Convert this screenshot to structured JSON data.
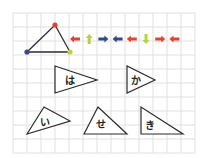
{
  "grid": {
    "x": 13,
    "y": 13,
    "cols": 13,
    "rows": 10,
    "cell": 14,
    "line_color": "#d9d9d9"
  },
  "reference_triangle": {
    "vertices": [
      {
        "name": "blue-vertex",
        "x": 27,
        "y": 52,
        "color": "#3b4a8a"
      },
      {
        "name": "red-vertex",
        "x": 55,
        "y": 25,
        "color": "#e8402a"
      },
      {
        "name": "green-vertex",
        "x": 70,
        "y": 52,
        "color": "#b7d33a"
      }
    ]
  },
  "arrows": [
    {
      "direction": "left",
      "color": "#e8402a"
    },
    {
      "direction": "up",
      "color": "#b7d33a"
    },
    {
      "direction": "right",
      "color": "#34478c"
    },
    {
      "direction": "left",
      "color": "#34478c"
    },
    {
      "direction": "left",
      "color": "#e8402a"
    },
    {
      "direction": "down",
      "color": "#b7d33a"
    },
    {
      "direction": "right",
      "color": "#e8402a"
    },
    {
      "direction": "left",
      "color": "#e8402a"
    }
  ],
  "triangles": [
    {
      "label": "は",
      "points": "55,66 55,93 97,80",
      "lx": 65,
      "ly": 84
    },
    {
      "label": "か",
      "points": "127,66 127,93 155,80",
      "lx": 131,
      "ly": 84
    },
    {
      "label": "い",
      "points": "27,134 44,107 70,121",
      "lx": 40,
      "ly": 126
    },
    {
      "label": "せ",
      "points": "84,134 98,107 127,134",
      "lx": 96,
      "ly": 128
    },
    {
      "label": "き",
      "points": "141,107 141,134 183,134",
      "lx": 145,
      "ly": 129
    }
  ]
}
